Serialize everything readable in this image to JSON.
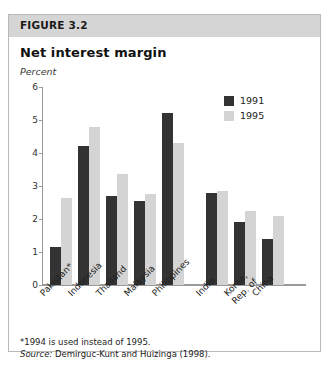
{
  "figure": {
    "label": "FIGURE 3.2",
    "title": "Net interest margin",
    "unit": "Percent",
    "footnote": "*1994 is used instead of 1995.",
    "source_label": "Source:",
    "source_text": " Demirguc-Kunt and Huizinga (1998)."
  },
  "colors": {
    "series_1991": "#333333",
    "series_1995": "#d4d4d4",
    "header_band": "#d5d5d5",
    "border": "#b9b9b9",
    "axis": "#9a9a9a"
  },
  "chart_data": {
    "type": "bar",
    "title": "Net interest margin",
    "xlabel": "",
    "ylabel": "Percent",
    "ylim": [
      0,
      6
    ],
    "yticks": [
      0,
      1,
      2,
      3,
      4,
      5,
      6
    ],
    "grid": false,
    "legend_position": "top-right",
    "categories": [
      "Pakistan*",
      "Indonesia",
      "Thailand",
      "Malaysia",
      "Philippines",
      "India",
      "Korea, Rep. of",
      "China"
    ],
    "category_labels": [
      {
        "line1": "Pakistan*",
        "line2": ""
      },
      {
        "line1": "Indonesia",
        "line2": ""
      },
      {
        "line1": "Thailand",
        "line2": ""
      },
      {
        "line1": "Malaysia",
        "line2": ""
      },
      {
        "line1": "Philippines",
        "line2": ""
      },
      {
        "line1": "India",
        "line2": ""
      },
      {
        "line1": "Korea,",
        "line2": "Rep. of"
      },
      {
        "line1": "China",
        "line2": ""
      }
    ],
    "group_break_after": "Philippines",
    "series": [
      {
        "name": "1991",
        "color": "#333333",
        "values": [
          1.15,
          4.2,
          2.7,
          2.55,
          5.2,
          2.8,
          1.9,
          1.4
        ]
      },
      {
        "name": "1995",
        "color": "#d4d4d4",
        "values": [
          2.65,
          4.8,
          3.35,
          2.75,
          4.3,
          2.85,
          2.25,
          2.1
        ]
      }
    ]
  }
}
